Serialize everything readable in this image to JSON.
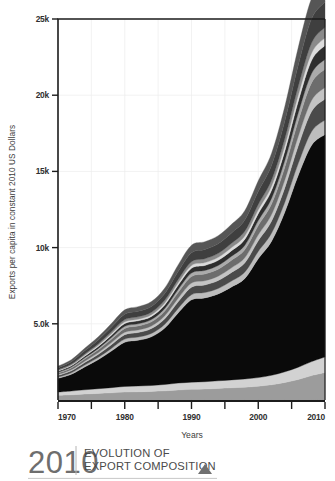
{
  "figure": {
    "title_year": "2010",
    "title_line1": "EVOLUTION OF",
    "title_line2": "EXPORT COMPOSITION",
    "marker_icon": "triangle-up-icon"
  },
  "chart_data": {
    "type": "area",
    "title": "EVOLUTION OF EXPORT COMPOSITION",
    "xlabel": "Years",
    "ylabel": "Exports per capita in constant 2010 US Dollars",
    "xlim": [
      1970,
      2010
    ],
    "ylim": [
      0,
      25000
    ],
    "grid": true,
    "legend": "none",
    "yticks": [
      0,
      5000,
      10000,
      15000,
      20000,
      25000
    ],
    "ytick_labels": [
      "",
      "5.0k",
      "10k",
      "15k",
      "20k",
      "25k"
    ],
    "xticks": [
      1970,
      1975,
      1980,
      1985,
      1990,
      1995,
      2000,
      2005,
      2010
    ],
    "xtick_labels": [
      "1970",
      "",
      "1980",
      "",
      "1990",
      "",
      "2000",
      "",
      "2010"
    ],
    "x": [
      1970,
      1972,
      1974,
      1976,
      1978,
      1980,
      1982,
      1984,
      1986,
      1988,
      1990,
      1992,
      1994,
      1996,
      1998,
      2000,
      2002,
      2004,
      2006,
      2008,
      2010
    ],
    "series": [
      {
        "name": "band-1-agriculture",
        "color": "#9c9c9c",
        "values": [
          300,
          340,
          390,
          430,
          470,
          520,
          540,
          560,
          600,
          660,
          700,
          720,
          760,
          800,
          840,
          900,
          1000,
          1150,
          1350,
          1600,
          1800
        ]
      },
      {
        "name": "band-2-raw-materials",
        "color": "#d2d2d2",
        "values": [
          220,
          250,
          280,
          310,
          340,
          370,
          380,
          390,
          420,
          450,
          470,
          480,
          500,
          520,
          540,
          570,
          620,
          700,
          800,
          920,
          1020
        ]
      },
      {
        "name": "band-3-manufactures",
        "color": "#0a0a0a",
        "values": [
          900,
          1100,
          1500,
          1900,
          2400,
          2900,
          3000,
          3200,
          3700,
          4600,
          5400,
          5500,
          5700,
          6100,
          6600,
          7800,
          8800,
          10500,
          12600,
          14200,
          14600
        ]
      },
      {
        "name": "band-4",
        "color": "#bdbdbd",
        "values": [
          80,
          95,
          120,
          145,
          175,
          205,
          210,
          220,
          250,
          300,
          340,
          350,
          360,
          390,
          420,
          480,
          540,
          650,
          780,
          900,
          950
        ]
      },
      {
        "name": "band-5",
        "color": "#4a4a4a",
        "values": [
          110,
          130,
          165,
          200,
          245,
          290,
          300,
          315,
          360,
          430,
          490,
          500,
          520,
          560,
          610,
          700,
          790,
          950,
          1150,
          1320,
          1380
        ]
      },
      {
        "name": "band-6",
        "color": "#c4c4c4",
        "values": [
          60,
          72,
          92,
          112,
          136,
          160,
          166,
          174,
          198,
          238,
          270,
          278,
          288,
          310,
          336,
          386,
          436,
          524,
          634,
          728,
          762
        ]
      },
      {
        "name": "band-7",
        "color": "#6d6d6d",
        "values": [
          95,
          114,
          146,
          178,
          216,
          254,
          264,
          276,
          314,
          378,
          430,
          442,
          458,
          492,
          534,
          612,
          692,
          832,
          1006,
          1156,
          1210
        ]
      },
      {
        "name": "band-8",
        "color": "#ababab",
        "values": [
          50,
          60,
          77,
          94,
          114,
          134,
          139,
          146,
          166,
          199,
          227,
          233,
          242,
          260,
          282,
          323,
          366,
          440,
          532,
          611,
          640
        ]
      },
      {
        "name": "band-9",
        "color": "#2e2e2e",
        "values": [
          70,
          84,
          108,
          131,
          159,
          187,
          195,
          204,
          232,
          279,
          317,
          326,
          338,
          363,
          394,
          452,
          511,
          614,
          743,
          853,
          893
        ]
      },
      {
        "name": "band-10",
        "color": "#dcdcdc",
        "values": [
          40,
          48,
          61,
          75,
          91,
          107,
          111,
          116,
          132,
          159,
          181,
          186,
          193,
          207,
          225,
          258,
          292,
          351,
          424,
          487,
          510
        ]
      },
      {
        "name": "band-11",
        "color": "#8a8a8a",
        "values": [
          55,
          66,
          85,
          103,
          125,
          147,
          153,
          160,
          182,
          219,
          249,
          256,
          265,
          285,
          309,
          355,
          401,
          482,
          583,
          669,
          700
        ]
      },
      {
        "name": "band-12",
        "color": "#3f3f3f",
        "values": [
          130,
          156,
          200,
          244,
          296,
          348,
          362,
          378,
          430,
          517,
          588,
          605,
          627,
          673,
          731,
          838,
          948,
          1139,
          1377,
          1582,
          1656
        ]
      },
      {
        "name": "band-13-services",
        "color": "#565656",
        "values": [
          110,
          132,
          169,
          206,
          250,
          294,
          306,
          320,
          364,
          437,
          497,
          511,
          530,
          569,
          618,
          708,
          801,
          963,
          1164,
          1337,
          1400
        ]
      }
    ]
  }
}
